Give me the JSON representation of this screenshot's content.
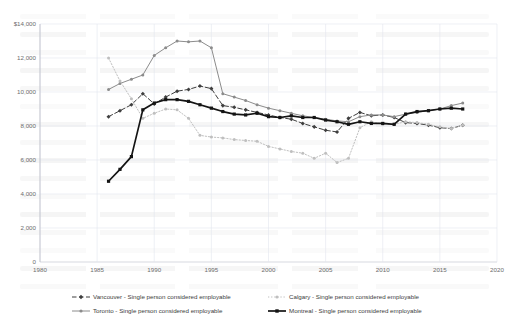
{
  "chart_data": {
    "type": "line",
    "title": "",
    "xlabel": "",
    "ylabel": "",
    "xlim": [
      1980,
      2020
    ],
    "ylim": [
      0,
      14000
    ],
    "grid": true,
    "legend_position": "bottom",
    "x_ticks": [
      "1980",
      "1985",
      "1990",
      "1995",
      "2000",
      "2005",
      "2010",
      "2015",
      "2020"
    ],
    "y_ticks": [
      "0",
      "2,000",
      "4,000",
      "6,000",
      "8,000",
      "10,000",
      "12,000",
      "$14,000"
    ],
    "y_tick_values": [
      0,
      2000,
      4000,
      6000,
      8000,
      10000,
      12000,
      14000
    ],
    "x_tick_values": [
      1980,
      1985,
      1990,
      1995,
      2000,
      2005,
      2010,
      2015,
      2020
    ],
    "series": [
      {
        "name": "Vancouver - Single person considered employable",
        "color": "#3f3f3f",
        "style": "dashed",
        "marker": "diamond",
        "x": [
          1986,
          1987,
          1988,
          1989,
          1990,
          1991,
          1992,
          1993,
          1994,
          1995,
          1996,
          1997,
          1998,
          1999,
          2000,
          2001,
          2002,
          2003,
          2004,
          2005,
          2006,
          2007,
          2008,
          2009,
          2010,
          2011,
          2012,
          2013,
          2014,
          2015,
          2016,
          2017
        ],
        "values": [
          8550,
          8900,
          9250,
          9900,
          9300,
          9700,
          10050,
          10150,
          10350,
          10200,
          9200,
          9100,
          8950,
          8800,
          8650,
          8500,
          8400,
          8150,
          7950,
          7750,
          7650,
          8450,
          8800,
          8600,
          8650,
          8500,
          8200,
          8150,
          8050,
          7900,
          7850,
          8050
        ]
      },
      {
        "name": "Toronto - Single person considered employable",
        "color": "#8c8c8c",
        "style": "solid",
        "marker": "circle",
        "x": [
          1986,
          1987,
          1988,
          1989,
          1990,
          1991,
          1992,
          1993,
          1994,
          1995,
          1996,
          1997,
          1998,
          1999,
          2000,
          2001,
          2002,
          2003,
          2004,
          2005,
          2006,
          2007,
          2008,
          2009,
          2010,
          2011,
          2012,
          2013,
          2014,
          2015,
          2016,
          2017
        ],
        "values": [
          10150,
          10500,
          10750,
          11000,
          12150,
          12600,
          13000,
          12950,
          13000,
          12600,
          9900,
          9700,
          9500,
          9250,
          9050,
          8900,
          8750,
          8600,
          8500,
          8400,
          8300,
          8250,
          8550,
          8650,
          8650,
          8550,
          8700,
          8800,
          8900,
          9000,
          9200,
          9350
        ]
      },
      {
        "name": "Calgary - Single person considered employable",
        "color": "#bfbfbf",
        "style": "dotted",
        "marker": "circle",
        "x": [
          1986,
          1987,
          1988,
          1989,
          1990,
          1991,
          1992,
          1993,
          1994,
          1995,
          1996,
          1997,
          1998,
          1999,
          2000,
          2001,
          2002,
          2003,
          2004,
          2005,
          2006,
          2007,
          2008,
          2009,
          2010,
          2011,
          2012,
          2013,
          2014,
          2015,
          2016,
          2017
        ],
        "values": [
          12000,
          10650,
          9600,
          8450,
          8750,
          9000,
          8950,
          8450,
          7450,
          7350,
          7300,
          7200,
          7150,
          7100,
          6800,
          6650,
          6500,
          6400,
          6100,
          6400,
          5850,
          6100,
          7900,
          8250,
          8100,
          8100,
          8250,
          8200,
          8100,
          7950,
          7850,
          8050
        ]
      },
      {
        "name": "Montreal - Single person considered employable",
        "color": "#141414",
        "style": "solid-thick",
        "marker": "square",
        "x": [
          1986,
          1987,
          1988,
          1989,
          1990,
          1991,
          1992,
          1993,
          1994,
          1995,
          1996,
          1997,
          1998,
          1999,
          2000,
          2001,
          2002,
          2003,
          2004,
          2005,
          2006,
          2007,
          2008,
          2009,
          2010,
          2011,
          2012,
          2013,
          2014,
          2015,
          2016,
          2017
        ],
        "values": [
          4750,
          5450,
          6200,
          8950,
          9350,
          9550,
          9550,
          9450,
          9250,
          9050,
          8850,
          8700,
          8650,
          8750,
          8550,
          8500,
          8600,
          8500,
          8500,
          8350,
          8250,
          8100,
          8250,
          8150,
          8150,
          8100,
          8700,
          8850,
          8900,
          9000,
          9050,
          9000
        ]
      }
    ]
  },
  "legend": {
    "items": [
      {
        "label": "Vancouver - Single person considered employable"
      },
      {
        "label": "Calgary - Single person considered employable"
      },
      {
        "label": "Toronto - Single person considered employable"
      },
      {
        "label": "Montreal - Single person considered employable"
      }
    ]
  }
}
